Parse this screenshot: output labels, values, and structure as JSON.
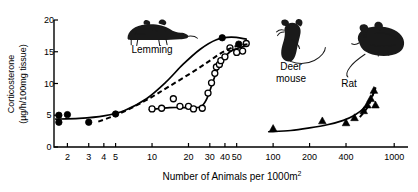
{
  "chart_data": {
    "type": "scatter",
    "title": "",
    "xlabel": "Number of Animals per 1000m2",
    "xlabel_base": "Number of Animals per 1000m",
    "xlabel_exponent": "2",
    "ylabel_line1": "Corticosterone",
    "ylabel_line2": "(µg/h/100mg tissue)",
    "xscale": "log",
    "xlim": [
      1.55,
      1300
    ],
    "ylim": [
      0,
      20
    ],
    "yticks": [
      0,
      5,
      10,
      15,
      20
    ],
    "ytick_labels": [
      "0",
      "5",
      "10",
      "15",
      "20"
    ],
    "xticks": [
      2,
      3,
      4,
      5,
      10,
      20,
      30,
      40,
      50,
      100,
      200,
      400,
      1000
    ],
    "xtick_labels": [
      "2",
      "3",
      "4",
      "5",
      "10",
      "20",
      "30",
      "40",
      "50",
      "100",
      "200",
      "400",
      "1000"
    ],
    "grid": false,
    "legend_position": "inline-annotations",
    "annotations": [
      {
        "name": "lemming",
        "text": "Lemming",
        "x_px": 152,
        "y_px": 53
      },
      {
        "name": "deer-mouse-line1",
        "text": "Deer",
        "x_px": 291,
        "y_px": 70
      },
      {
        "name": "deer-mouse-line2",
        "text": "mouse",
        "x_px": 291,
        "y_px": 82
      },
      {
        "name": "rat",
        "text": "Rat",
        "x_px": 349,
        "y_px": 87
      }
    ],
    "series": [
      {
        "name": "Lemming",
        "marker": "filled-circle",
        "curve": "solid",
        "points": [
          {
            "x": 1.7,
            "y": 5.0
          },
          {
            "x": 1.7,
            "y": 3.9
          },
          {
            "x": 2.0,
            "y": 5.1
          },
          {
            "x": 3.0,
            "y": 3.9
          },
          {
            "x": 5.0,
            "y": 5.2
          },
          {
            "x": 38.0,
            "y": 17.2
          },
          {
            "x": 52.0,
            "y": 16.2
          }
        ],
        "curve_points": [
          {
            "x": 1.6,
            "y": 4.4
          },
          {
            "x": 2.5,
            "y": 4.5
          },
          {
            "x": 4.0,
            "y": 4.9
          },
          {
            "x": 6.0,
            "y": 5.8
          },
          {
            "x": 9.0,
            "y": 7.6
          },
          {
            "x": 13.0,
            "y": 10.2
          },
          {
            "x": 18.0,
            "y": 13.0
          },
          {
            "x": 25.0,
            "y": 15.4
          },
          {
            "x": 34.0,
            "y": 16.9
          },
          {
            "x": 45.0,
            "y": 17.3
          },
          {
            "x": 60.0,
            "y": 17.0
          }
        ]
      },
      {
        "name": "Deer mouse",
        "marker": "open-circle",
        "curve": "solid",
        "points": [
          {
            "x": 10.0,
            "y": 6.0
          },
          {
            "x": 12.0,
            "y": 6.1
          },
          {
            "x": 15.0,
            "y": 7.6
          },
          {
            "x": 17.0,
            "y": 6.4
          },
          {
            "x": 20.0,
            "y": 6.4
          },
          {
            "x": 22.0,
            "y": 6.0
          },
          {
            "x": 26.0,
            "y": 6.1
          },
          {
            "x": 29.0,
            "y": 8.5
          },
          {
            "x": 31.0,
            "y": 10.1
          },
          {
            "x": 33.0,
            "y": 11.6
          },
          {
            "x": 34.0,
            "y": 12.6
          },
          {
            "x": 36.0,
            "y": 13.0
          },
          {
            "x": 37.0,
            "y": 13.6
          },
          {
            "x": 40.0,
            "y": 14.2
          },
          {
            "x": 44.0,
            "y": 15.6
          },
          {
            "x": 50.0,
            "y": 14.9
          },
          {
            "x": 56.0,
            "y": 15.1
          },
          {
            "x": 60.0,
            "y": 16.3
          }
        ],
        "curve_points": [
          {
            "x": 9.5,
            "y": 5.9
          },
          {
            "x": 14.0,
            "y": 6.2
          },
          {
            "x": 20.0,
            "y": 6.2
          },
          {
            "x": 25.0,
            "y": 6.3
          },
          {
            "x": 28.0,
            "y": 7.4
          },
          {
            "x": 31.0,
            "y": 9.6
          },
          {
            "x": 34.0,
            "y": 11.8
          },
          {
            "x": 38.0,
            "y": 13.6
          },
          {
            "x": 44.0,
            "y": 15.0
          },
          {
            "x": 52.0,
            "y": 15.6
          },
          {
            "x": 62.0,
            "y": 16.0
          }
        ]
      },
      {
        "name": "Dashed trend",
        "marker": "none",
        "curve": "dashed",
        "curve_points": [
          {
            "x": 3.6,
            "y": 4.0
          },
          {
            "x": 5.0,
            "y": 5.0
          },
          {
            "x": 7.0,
            "y": 6.3
          },
          {
            "x": 10.0,
            "y": 7.9
          },
          {
            "x": 14.0,
            "y": 9.6
          },
          {
            "x": 20.0,
            "y": 11.4
          },
          {
            "x": 28.0,
            "y": 13.2
          },
          {
            "x": 38.0,
            "y": 14.9
          },
          {
            "x": 50.0,
            "y": 15.9
          },
          {
            "x": 62.0,
            "y": 16.2
          }
        ]
      },
      {
        "name": "Rat",
        "marker": "filled-triangle",
        "curve": "solid",
        "points": [
          {
            "x": 100.0,
            "y": 2.9
          },
          {
            "x": 255.0,
            "y": 4.1
          },
          {
            "x": 400.0,
            "y": 3.8
          },
          {
            "x": 470.0,
            "y": 4.6
          },
          {
            "x": 560.0,
            "y": 5.7
          },
          {
            "x": 600.0,
            "y": 6.6
          },
          {
            "x": 640.0,
            "y": 7.6
          },
          {
            "x": 680.0,
            "y": 8.9
          },
          {
            "x": 700.0,
            "y": 6.6
          }
        ],
        "curve_points": [
          {
            "x": 92.0,
            "y": 2.4
          },
          {
            "x": 140.0,
            "y": 2.6
          },
          {
            "x": 200.0,
            "y": 3.0
          },
          {
            "x": 280.0,
            "y": 3.5
          },
          {
            "x": 380.0,
            "y": 4.2
          },
          {
            "x": 470.0,
            "y": 5.0
          },
          {
            "x": 560.0,
            "y": 6.1
          },
          {
            "x": 640.0,
            "y": 7.6
          },
          {
            "x": 700.0,
            "y": 9.2
          }
        ],
        "dashed_segment": [
          {
            "x": 520.0,
            "y": 4.7
          },
          {
            "x": 580.0,
            "y": 5.8
          },
          {
            "x": 630.0,
            "y": 7.0
          },
          {
            "x": 675.0,
            "y": 8.5
          },
          {
            "x": 700.0,
            "y": 9.4
          }
        ]
      }
    ]
  },
  "illustrations": [
    {
      "name": "lemming-illustration",
      "label": "lemming"
    },
    {
      "name": "deer-mouse-illustration",
      "label": "deer mouse"
    },
    {
      "name": "rat-illustration",
      "label": "rat"
    }
  ]
}
